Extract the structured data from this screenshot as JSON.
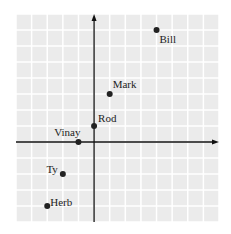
{
  "chart_data": {
    "type": "scatter",
    "title": "",
    "xlabel": "",
    "ylabel": "",
    "xlim": [
      -5,
      8
    ],
    "ylim": [
      -5,
      8
    ],
    "grid": true,
    "legend": null,
    "points": [
      {
        "name": "Bill",
        "x": 4,
        "y": 7
      },
      {
        "name": "Mark",
        "x": 1,
        "y": 3
      },
      {
        "name": "Rod",
        "x": 0,
        "y": 1
      },
      {
        "name": "Vinay",
        "x": -1,
        "y": 0
      },
      {
        "name": "Ty",
        "x": -2,
        "y": -2
      },
      {
        "name": "Herb",
        "x": -3,
        "y": -4
      }
    ]
  },
  "style": {
    "grid_background": "#ebebeb",
    "grid_line": "#ffffff",
    "axis_color": "#111111",
    "point_color": "#222222"
  }
}
